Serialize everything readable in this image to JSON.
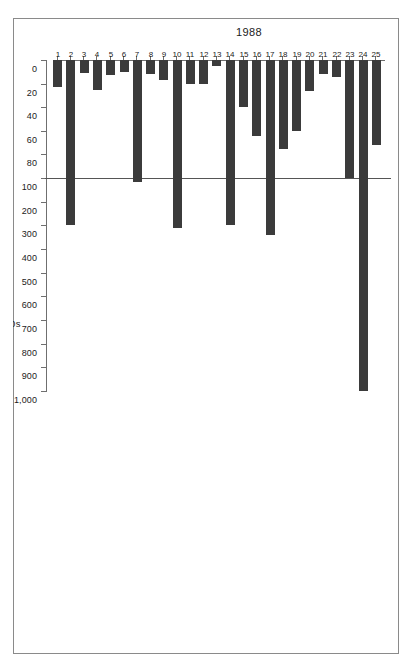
{
  "chart_data": {
    "type": "bar",
    "orientation": "horizontal",
    "title": "1988",
    "xlabel": "£000s",
    "ylabel": "",
    "series_label": "1988",
    "categories": [
      "1",
      "2",
      "3",
      "4",
      "5",
      "6",
      "7",
      "8",
      "9",
      "10",
      "11",
      "12",
      "13",
      "14",
      "15",
      "16",
      "17",
      "18",
      "19",
      "20",
      "21",
      "22",
      "23",
      "24",
      "25"
    ],
    "values": [
      23,
      300,
      11,
      25,
      13,
      10,
      115,
      12,
      17,
      310,
      20,
      20,
      5,
      300,
      40,
      64,
      340,
      75,
      60,
      26,
      12,
      14,
      100,
      1000,
      72
    ],
    "tick_labels": [
      "0",
      "20",
      "40",
      "60",
      "80",
      "100",
      "200",
      "300",
      "400",
      "500",
      "600",
      "700",
      "800",
      "900",
      "1,000"
    ],
    "tick_values": [
      0,
      20,
      40,
      60,
      80,
      100,
      200,
      300,
      400,
      500,
      600,
      700,
      800,
      900,
      1000
    ],
    "axis_note": "piecewise scale: 0-100 compressed segment then 100-1,000 segment",
    "xlim": [
      0,
      1000
    ],
    "grid": false,
    "legend": false,
    "reference_line_value": 100,
    "bar_color": "#3b3b3b",
    "axis_color": "#6f6f6f"
  },
  "figure": {
    "frame_border_color": "#8a8a8a",
    "background": "#ffffff"
  }
}
